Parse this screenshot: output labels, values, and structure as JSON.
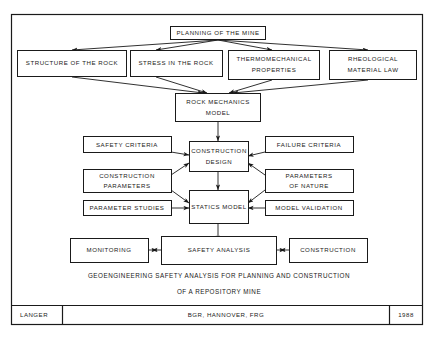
{
  "diagram": {
    "title_caption": [
      "GEOENGINEERING SAFETY ANALYSIS FOR PLANNING AND CONSTRUCTION",
      "OF A REPOSITORY MINE"
    ],
    "nodes": {
      "planning": {
        "label": "PLANNING OF THE MINE"
      },
      "structure": {
        "label": "STRUCTURE OF THE ROCK"
      },
      "stress": {
        "label": "STRESS IN THE ROCK"
      },
      "thermo_line1": {
        "label": "THERMOMECHANICAL"
      },
      "thermo_line2": {
        "label": "PROPERTIES"
      },
      "rheo_line1": {
        "label": "RHEOLOGICAL"
      },
      "rheo_line2": {
        "label": "MATERIAL LAW"
      },
      "rockmech_line1": {
        "label": "ROCK MECHANICS"
      },
      "rockmech_line2": {
        "label": "MODEL"
      },
      "safety_criteria": {
        "label": "SAFETY CRITERIA"
      },
      "failure_criteria": {
        "label": "FAILURE CRITERIA"
      },
      "construction_design_line1": {
        "label": "CONSTRUCTION"
      },
      "construction_design_line2": {
        "label": "DESIGN"
      },
      "construction_params_line1": {
        "label": "CONSTRUCTION"
      },
      "construction_params_line2": {
        "label": "PARAMETERS"
      },
      "parameters_nature_line1": {
        "label": "PARAMETERS"
      },
      "parameters_nature_line2": {
        "label": "OF NATURE"
      },
      "parameter_studies": {
        "label": "PARAMETER STUDIES"
      },
      "statics_model": {
        "label": "STATICS MODEL"
      },
      "model_validation": {
        "label": "MODEL VALIDATION"
      },
      "monitoring": {
        "label": "MONITORING"
      },
      "safety_analysis": {
        "label": "SAFETY ANALYSIS"
      },
      "construction": {
        "label": "CONSTRUCTION"
      }
    },
    "footer": {
      "author": "LANGER",
      "organization": "BGR, HANNOVER, FRG",
      "year": "1988"
    },
    "colors": {
      "ink": "#1a1a1a",
      "background": "#ffffff"
    }
  }
}
